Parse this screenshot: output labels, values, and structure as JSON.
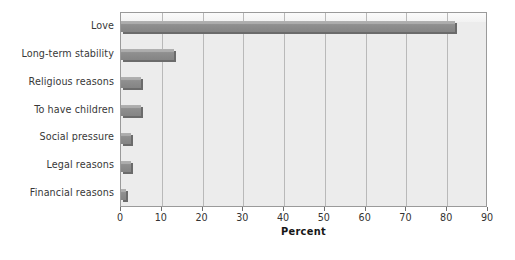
{
  "chart_data": {
    "type": "bar",
    "orientation": "horizontal",
    "title": "",
    "xlabel": "Percent",
    "ylabel": "",
    "xlim": [
      0,
      90
    ],
    "xticks": [
      0,
      10,
      20,
      30,
      40,
      50,
      60,
      70,
      80,
      90
    ],
    "xtick_labels": [
      "0",
      "10",
      "20",
      "30",
      "40",
      "50",
      "60",
      "70",
      "80",
      "90"
    ],
    "grid": "vertical",
    "legend": "none",
    "categories": [
      "Love",
      "Long-term stability",
      "Religious reasons",
      "To have children",
      "Social pressure",
      "Legal reasons",
      "Financial reasons"
    ],
    "values": [
      82,
      13,
      5,
      5,
      2.5,
      2.5,
      1.3
    ],
    "series": [
      {
        "name": "Percent",
        "values": [
          82,
          13,
          5,
          5,
          2.5,
          2.5,
          1.3
        ]
      }
    ],
    "colors": {
      "bar_fill": "#8d8d8d",
      "bar_shadow": "#6b6b6b",
      "plot_background": "#ececec",
      "gridline": "#b9b9b9",
      "frame": "#9a9a9a",
      "label_text": "#383838",
      "axis_title_text": "#161616",
      "page_background": "#ffffff"
    }
  }
}
